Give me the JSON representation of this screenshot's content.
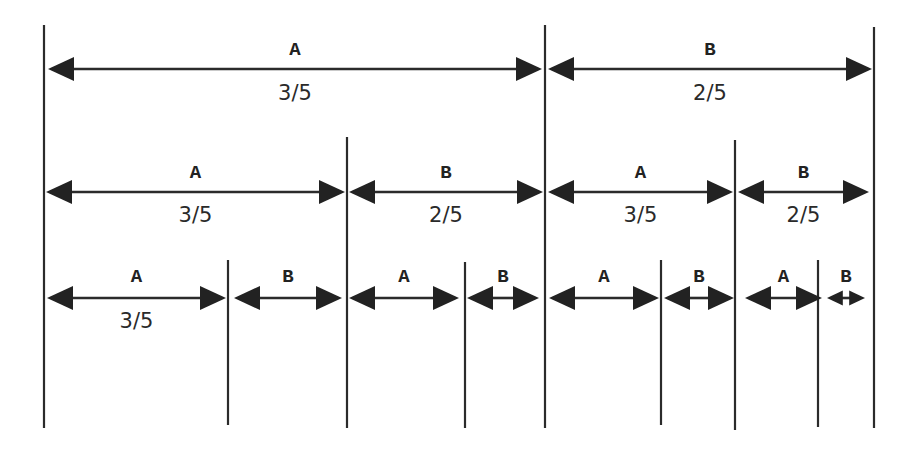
{
  "diagram": {
    "colors": {
      "line": "#2b2b2b",
      "arrowhead": "#222222",
      "background": "#ffffff"
    },
    "vertical_lines": [
      {
        "x": 44,
        "y1": 25,
        "y2": 428
      },
      {
        "x": 545,
        "y1": 25,
        "y2": 428
      },
      {
        "x": 874,
        "y1": 27,
        "y2": 428
      },
      {
        "x": 347,
        "y1": 137,
        "y2": 428
      },
      {
        "x": 735,
        "y1": 140,
        "y2": 430
      },
      {
        "x": 228,
        "y1": 260,
        "y2": 425
      },
      {
        "x": 465,
        "y1": 262,
        "y2": 428
      },
      {
        "x": 661,
        "y1": 260,
        "y2": 425
      },
      {
        "x": 818,
        "y1": 260,
        "y2": 427
      }
    ],
    "rows": [
      {
        "y": 69,
        "label_y": 55,
        "frac_y": 100,
        "segments": [
          {
            "x1": 48,
            "x2": 542,
            "label": "A",
            "fraction": "3/5"
          },
          {
            "x1": 548,
            "x2": 872,
            "label": "B",
            "fraction": "2/5"
          }
        ]
      },
      {
        "y": 192,
        "label_y": 178,
        "frac_y": 222,
        "segments": [
          {
            "x1": 46,
            "x2": 345,
            "label": "A",
            "fraction": "3/5"
          },
          {
            "x1": 349,
            "x2": 543,
            "label": "B",
            "fraction": "2/5"
          },
          {
            "x1": 548,
            "x2": 733,
            "label": "A",
            "fraction": "3/5"
          },
          {
            "x1": 738,
            "x2": 869,
            "label": "B",
            "fraction": "2/5"
          }
        ]
      },
      {
        "y": 298,
        "label_y": 282,
        "frac_y": 328,
        "segments": [
          {
            "x1": 47,
            "x2": 226,
            "label": "A",
            "fraction": "3/5"
          },
          {
            "x1": 234,
            "x2": 342,
            "label": "B",
            "fraction": ""
          },
          {
            "x1": 349,
            "x2": 459,
            "label": "A",
            "fraction": ""
          },
          {
            "x1": 467,
            "x2": 539,
            "label": "B",
            "fraction": ""
          },
          {
            "x1": 549,
            "x2": 659,
            "label": "A",
            "fraction": ""
          },
          {
            "x1": 664,
            "x2": 734,
            "label": "B",
            "fraction": ""
          },
          {
            "x1": 745,
            "x2": 822,
            "label": "A",
            "fraction": ""
          },
          {
            "x1": 827,
            "x2": 865,
            "label": "B",
            "fraction": ""
          }
        ]
      }
    ]
  }
}
